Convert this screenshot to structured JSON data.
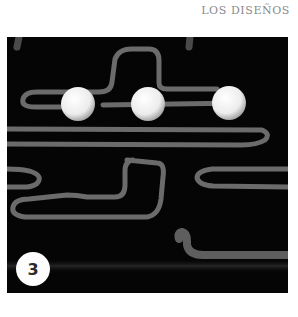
{
  "header": {
    "section_title": "LOS DISEÑOS"
  },
  "figure": {
    "step_number": "3",
    "colors": {
      "background": "#050505",
      "rope": "#6e6e6e",
      "ball": "#f4f4f4",
      "badge": "#fdfdfd"
    }
  },
  "caption": {
    "text": ""
  }
}
